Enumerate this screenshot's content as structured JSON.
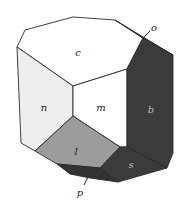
{
  "figure": {
    "type": "crystal-habit-drawing",
    "faces": [
      {
        "id": "c",
        "label": "c",
        "fill": "#ffffff",
        "label_color": "#222222"
      },
      {
        "id": "n",
        "label": "n",
        "fill": "#eeeeee",
        "label_color": "#222222"
      },
      {
        "id": "m",
        "label": "m",
        "fill": "#ffffff",
        "label_color": "#222222"
      },
      {
        "id": "b",
        "label": "b",
        "fill": "#3b3b3b",
        "label_color": "#bbbbbb"
      },
      {
        "id": "l",
        "label": "l",
        "fill": "#9c9c9c",
        "label_color": "#222222"
      },
      {
        "id": "s",
        "label": "s",
        "fill": "#3b3b3b",
        "label_color": "#bbbbbb"
      },
      {
        "id": "p",
        "label": "p",
        "fill": "#333333",
        "label_color": "#222222"
      },
      {
        "id": "o",
        "label": "o",
        "fill": "#2a2a2a",
        "label_color": "#222222"
      }
    ]
  }
}
